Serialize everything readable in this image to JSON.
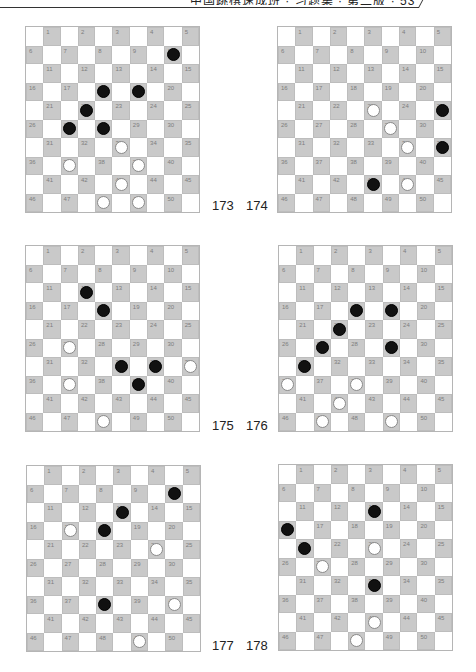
{
  "header": {
    "text": "中国跳棋速成班 · 习题集 · 第二版 · 53"
  },
  "colors": {
    "dark_square": "#c9c9c9",
    "light_square": "#ffffff",
    "square_number": "#7d7d7d",
    "black_piece": "#111111",
    "white_piece": "#ffffff"
  },
  "boards": [
    {
      "label": "173",
      "black": [
        10,
        18,
        19,
        22,
        27,
        28
      ],
      "white": [
        33,
        37,
        39,
        43,
        48,
        49
      ]
    },
    {
      "label": "174",
      "black": [
        25,
        35,
        43
      ],
      "white": [
        23,
        29,
        34,
        44
      ]
    },
    {
      "label": "175",
      "black": [
        12,
        18,
        33,
        34,
        39
      ],
      "white": [
        27,
        35,
        37,
        48
      ]
    },
    {
      "label": "176",
      "black": [
        18,
        19,
        22,
        27,
        29,
        31
      ],
      "white": [
        36,
        38,
        42,
        47,
        49
      ]
    },
    {
      "label": "177",
      "black": [
        10,
        13,
        18,
        38
      ],
      "white": [
        17,
        24,
        40,
        49
      ]
    },
    {
      "label": "178",
      "black": [
        13,
        16,
        21,
        33
      ],
      "white": [
        23,
        27,
        43,
        48
      ]
    }
  ]
}
